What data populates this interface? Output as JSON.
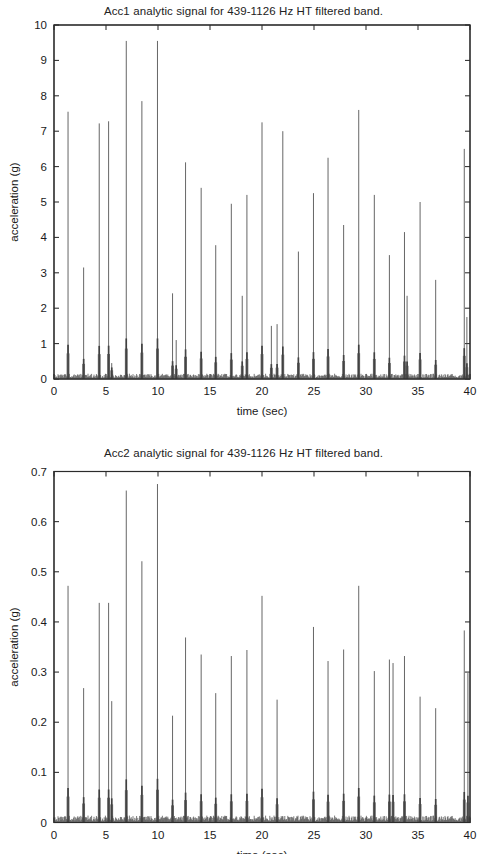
{
  "page": {
    "background_color": "#ffffff",
    "ink_color": "#2b2b2b"
  },
  "figures": [
    {
      "id": "acc1",
      "title": "Acc1 analytic signal for 439-1126 Hz HT filtered band."
    },
    {
      "id": "acc2",
      "title": "Acc2 analytic signal for 439-1126 Hz HT filtered band."
    }
  ],
  "chart_data": [
    {
      "type": "line",
      "id": "acc1",
      "title": "Acc1 analytic signal for 439-1126 Hz HT filtered band.",
      "xlabel": "time (sec)",
      "ylabel": "acceleration (g)",
      "xlim": [
        0,
        40
      ],
      "ylim": [
        0,
        10
      ],
      "xticks": [
        0,
        5,
        10,
        15,
        20,
        25,
        30,
        35,
        40
      ],
      "xticklabels": [
        "0",
        "5",
        "10",
        "15",
        "20",
        "25",
        "30",
        "35",
        "40"
      ],
      "yticks": [
        0,
        1,
        2,
        3,
        4,
        5,
        6,
        7,
        8,
        9,
        10
      ],
      "yticklabels": [
        "0",
        "1",
        "2",
        "3",
        "4",
        "5",
        "6",
        "7",
        "8",
        "9",
        "10"
      ],
      "grid": false,
      "legend": null,
      "series_name": "Acc1 analytic envelope",
      "line_color": "#4a4a4a",
      "peaks": [
        {
          "x": 1.35,
          "y": 7.55
        },
        {
          "x": 2.85,
          "y": 3.15
        },
        {
          "x": 4.35,
          "y": 7.22
        },
        {
          "x": 5.25,
          "y": 7.28
        },
        {
          "x": 5.55,
          "y": 0.45
        },
        {
          "x": 6.95,
          "y": 9.55
        },
        {
          "x": 8.45,
          "y": 7.85
        },
        {
          "x": 9.95,
          "y": 9.55
        },
        {
          "x": 11.4,
          "y": 2.42
        },
        {
          "x": 11.75,
          "y": 1.1
        },
        {
          "x": 12.65,
          "y": 6.12
        },
        {
          "x": 14.15,
          "y": 5.4
        },
        {
          "x": 15.55,
          "y": 3.78
        },
        {
          "x": 17.05,
          "y": 4.95
        },
        {
          "x": 18.1,
          "y": 2.35
        },
        {
          "x": 18.55,
          "y": 5.2
        },
        {
          "x": 20.0,
          "y": 7.25
        },
        {
          "x": 20.9,
          "y": 1.5
        },
        {
          "x": 21.45,
          "y": 1.55
        },
        {
          "x": 22.0,
          "y": 7.0
        },
        {
          "x": 23.5,
          "y": 3.6
        },
        {
          "x": 24.95,
          "y": 5.25
        },
        {
          "x": 26.35,
          "y": 6.25
        },
        {
          "x": 27.85,
          "y": 4.35
        },
        {
          "x": 29.3,
          "y": 7.6
        },
        {
          "x": 30.8,
          "y": 5.2
        },
        {
          "x": 32.25,
          "y": 3.5
        },
        {
          "x": 33.7,
          "y": 4.15
        },
        {
          "x": 33.95,
          "y": 2.35
        },
        {
          "x": 35.2,
          "y": 5.0
        },
        {
          "x": 36.7,
          "y": 2.8
        },
        {
          "x": 39.45,
          "y": 6.5
        },
        {
          "x": 39.7,
          "y": 1.75
        }
      ],
      "baseline_noise_level": 0.13
    },
    {
      "type": "line",
      "id": "acc2",
      "title": "Acc2 analytic signal for 439-1126 Hz HT filtered band.",
      "xlabel": "time (sec)",
      "ylabel": "acceleration (g)",
      "xlim": [
        0,
        40
      ],
      "ylim": [
        0,
        0.7
      ],
      "xticks": [
        0,
        5,
        10,
        15,
        20,
        25,
        30,
        35,
        40
      ],
      "xticklabels": [
        "0",
        "5",
        "10",
        "15",
        "20",
        "25",
        "30",
        "35",
        "40"
      ],
      "yticks": [
        0,
        0.1,
        0.2,
        0.3,
        0.4,
        0.5,
        0.6,
        0.7
      ],
      "yticklabels": [
        "0",
        "0.1",
        "0.2",
        "0.3",
        "0.4",
        "0.5",
        "0.6",
        "0.7"
      ],
      "grid": false,
      "legend": null,
      "series_name": "Acc2 analytic envelope",
      "line_color": "#4a4a4a",
      "peaks": [
        {
          "x": 1.35,
          "y": 0.472
        },
        {
          "x": 2.85,
          "y": 0.268
        },
        {
          "x": 4.35,
          "y": 0.438
        },
        {
          "x": 5.25,
          "y": 0.438
        },
        {
          "x": 5.55,
          "y": 0.242
        },
        {
          "x": 6.95,
          "y": 0.662
        },
        {
          "x": 8.45,
          "y": 0.521
        },
        {
          "x": 9.95,
          "y": 0.675
        },
        {
          "x": 11.4,
          "y": 0.213
        },
        {
          "x": 12.65,
          "y": 0.369
        },
        {
          "x": 14.15,
          "y": 0.335
        },
        {
          "x": 15.55,
          "y": 0.258
        },
        {
          "x": 17.05,
          "y": 0.332
        },
        {
          "x": 18.55,
          "y": 0.344
        },
        {
          "x": 20.0,
          "y": 0.452
        },
        {
          "x": 21.45,
          "y": 0.245
        },
        {
          "x": 24.95,
          "y": 0.39
        },
        {
          "x": 26.35,
          "y": 0.322
        },
        {
          "x": 27.85,
          "y": 0.345
        },
        {
          "x": 29.3,
          "y": 0.472
        },
        {
          "x": 30.8,
          "y": 0.302
        },
        {
          "x": 32.25,
          "y": 0.325
        },
        {
          "x": 32.6,
          "y": 0.318
        },
        {
          "x": 33.7,
          "y": 0.332
        },
        {
          "x": 35.2,
          "y": 0.251
        },
        {
          "x": 36.7,
          "y": 0.228
        },
        {
          "x": 39.45,
          "y": 0.383
        },
        {
          "x": 39.8,
          "y": 0.298
        }
      ],
      "baseline_noise_level": 0.012
    }
  ]
}
